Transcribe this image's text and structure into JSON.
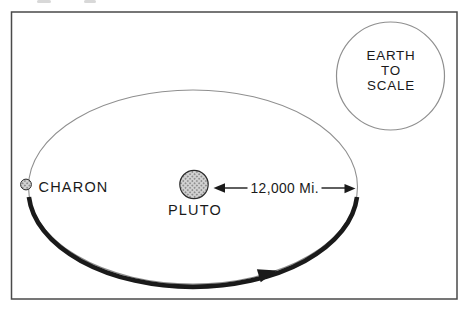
{
  "figure": {
    "charon_label": "CHARON",
    "pluto_label": "PLUTO",
    "distance_label": "12,000 Mi.",
    "earth_label_lines": [
      "EARTH",
      "TO",
      "SCALE"
    ]
  },
  "colors": {
    "background": "#ffffff",
    "ink": "#1a1a1a",
    "frame": "#4a4a4a",
    "orbit": "#8f8f8f",
    "halftone_base": "#d4d4d4",
    "halftone_dot": "#8f8f8f"
  }
}
